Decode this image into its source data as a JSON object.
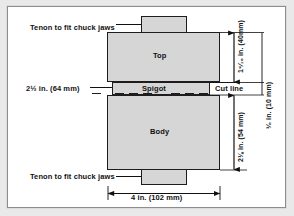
{
  "figure": {
    "background_color": "#ffffff",
    "page_color": "#e9e9e9",
    "shape_fill": "#d6d6d6",
    "line_color": "#1d1d1d"
  },
  "parts": {
    "top_label": "Top",
    "body_label": "Body",
    "spigot_label": "Spigot",
    "cut_line_label": "Cut line"
  },
  "callouts": {
    "tenon_top": "Tenon to fit chuck jaws",
    "tenon_bottom": "Tenon to fit chuck jaws"
  },
  "dimensions": {
    "top_height": "1⁹⁄₁₆ in. (40mm)",
    "spigot_height": "³⁄₈ in. (10 mm)",
    "body_height": "2⅛ in. (54 mm)",
    "spigot_width": "2½ in. (64 mm)",
    "overall_width": "4 in. (102 mm)"
  }
}
